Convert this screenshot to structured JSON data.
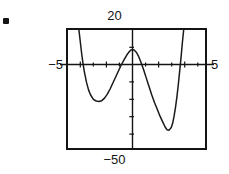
{
  "figure": {
    "kind": "graphing-calculator-window",
    "bullet": "list-bullet",
    "labels": {
      "y_max": "20",
      "y_min": "−50",
      "x_min": "−5",
      "x_max": "5"
    }
  },
  "chart_data": {
    "type": "line",
    "title": "",
    "xlabel": "",
    "ylabel": "",
    "xlim": [
      -5,
      5
    ],
    "ylim": [
      -50,
      20
    ],
    "grid": false,
    "legend": null,
    "axes": {
      "x_axis_value": 0,
      "y_axis_value": 0,
      "x_tick_interval": 1,
      "y_tick_interval": 10,
      "x_ticks": [
        -4,
        -3,
        -2,
        -1,
        1,
        2,
        3,
        4
      ],
      "y_ticks": [
        -40,
        -30,
        -20,
        -10,
        10
      ]
    },
    "series": [
      {
        "name": "curve",
        "style": "solid-thin-black",
        "color": "#141414",
        "features": {
          "enters_top_at_x": -4.15,
          "local_minimum": [
            -2.6,
            -22
          ],
          "local_maximum": [
            -0.3,
            8
          ],
          "global_minimum_in_window": [
            2.2,
            -39
          ],
          "exits_top_at_x": 3.4
        },
        "points": [
          [
            -4.15,
            20
          ],
          [
            -4.05,
            13
          ],
          [
            -3.95,
            6
          ],
          [
            -3.85,
            0
          ],
          [
            -3.75,
            -5
          ],
          [
            -3.6,
            -11
          ],
          [
            -3.45,
            -15.5
          ],
          [
            -3.3,
            -18.5
          ],
          [
            -3.1,
            -21
          ],
          [
            -2.9,
            -22
          ],
          [
            -2.7,
            -22.3
          ],
          [
            -2.5,
            -21.8
          ],
          [
            -2.3,
            -20.3
          ],
          [
            -2.1,
            -18
          ],
          [
            -1.9,
            -15
          ],
          [
            -1.7,
            -11.5
          ],
          [
            -1.5,
            -8
          ],
          [
            -1.3,
            -4.5
          ],
          [
            -1.1,
            -1
          ],
          [
            -0.9,
            2
          ],
          [
            -0.7,
            4.8
          ],
          [
            -0.55,
            6.5
          ],
          [
            -0.4,
            7.7
          ],
          [
            -0.28,
            8.0
          ],
          [
            -0.15,
            7.6
          ],
          [
            0.0,
            6.3
          ],
          [
            0.15,
            4.0
          ],
          [
            0.3,
            1.0
          ],
          [
            0.5,
            -3.5
          ],
          [
            0.7,
            -8.5
          ],
          [
            0.9,
            -13.5
          ],
          [
            1.1,
            -18.5
          ],
          [
            1.3,
            -23
          ],
          [
            1.5,
            -27
          ],
          [
            1.7,
            -31
          ],
          [
            1.9,
            -34.5
          ],
          [
            2.05,
            -37
          ],
          [
            2.2,
            -38.8
          ],
          [
            2.35,
            -39
          ],
          [
            2.5,
            -37.5
          ],
          [
            2.6,
            -35
          ],
          [
            2.7,
            -31
          ],
          [
            2.8,
            -26
          ],
          [
            2.9,
            -20
          ],
          [
            3.0,
            -13
          ],
          [
            3.1,
            -5
          ],
          [
            3.2,
            3
          ],
          [
            3.3,
            12
          ],
          [
            3.4,
            20
          ]
        ]
      }
    ]
  }
}
